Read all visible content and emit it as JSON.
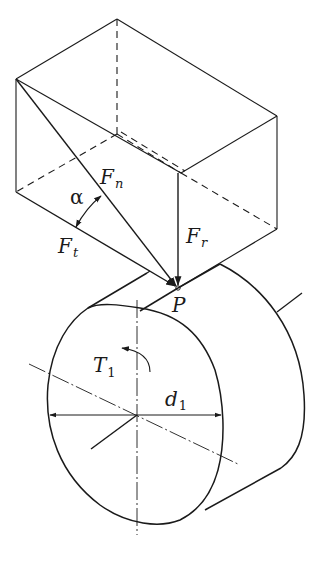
{
  "figure": {
    "labels": {
      "Fn": {
        "main": "F",
        "sub": "n"
      },
      "Ft": {
        "main": "F",
        "sub": "t"
      },
      "Fr": {
        "main": "F",
        "sub": "r"
      },
      "alpha": "α",
      "P": "P",
      "T1": {
        "main": "T",
        "sub": "1"
      },
      "d1": {
        "main": "d",
        "sub": "1"
      }
    },
    "colors": {
      "stroke": "#1a1a1a",
      "background": "#ffffff"
    }
  }
}
